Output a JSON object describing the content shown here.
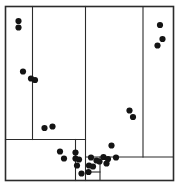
{
  "figure": {
    "title": "",
    "width": 180,
    "height": 188,
    "background_color": "#ffffff",
    "line_color": "#2b2b2b",
    "point_color": "#141414"
  },
  "chart_data": {
    "type": "scatter",
    "title": "",
    "subtitle": "",
    "xlabel": "",
    "ylabel": "",
    "xlim": [
      0,
      180
    ],
    "ylim": [
      0,
      188
    ],
    "grid": false,
    "legend": null,
    "annotations": [],
    "point_radius": 3.1,
    "points": [
      {
        "x": 18.5,
        "y": 21.0
      },
      {
        "x": 18.5,
        "y": 27.5
      },
      {
        "x": 160.0,
        "y": 25.0
      },
      {
        "x": 162.5,
        "y": 39.0
      },
      {
        "x": 157.5,
        "y": 45.5
      },
      {
        "x": 23.0,
        "y": 71.5
      },
      {
        "x": 31.0,
        "y": 78.5
      },
      {
        "x": 35.0,
        "y": 80.0
      },
      {
        "x": 129.5,
        "y": 110.5
      },
      {
        "x": 133.0,
        "y": 117.0
      },
      {
        "x": 44.5,
        "y": 128.0
      },
      {
        "x": 52.5,
        "y": 126.5
      },
      {
        "x": 111.5,
        "y": 145.5
      },
      {
        "x": 60.0,
        "y": 151.5
      },
      {
        "x": 75.5,
        "y": 152.5
      },
      {
        "x": 64.0,
        "y": 158.5
      },
      {
        "x": 75.5,
        "y": 158.5
      },
      {
        "x": 79.0,
        "y": 159.5
      },
      {
        "x": 91.0,
        "y": 157.5
      },
      {
        "x": 103.5,
        "y": 157.0
      },
      {
        "x": 108.0,
        "y": 159.0
      },
      {
        "x": 116.0,
        "y": 157.5
      },
      {
        "x": 77.0,
        "y": 165.5
      },
      {
        "x": 96.5,
        "y": 160.5
      },
      {
        "x": 99.5,
        "y": 161.5
      },
      {
        "x": 89.0,
        "y": 165.5
      },
      {
        "x": 106.5,
        "y": 163.5
      },
      {
        "x": 93.0,
        "y": 166.5
      },
      {
        "x": 81.5,
        "y": 173.5
      },
      {
        "x": 88.5,
        "y": 172.0
      }
    ],
    "partition_frame": {
      "x0": 5.5,
      "y0": 6.5,
      "x1": 173.5,
      "y1": 180.5
    },
    "partition_splits": [
      {
        "id": "split-v1",
        "orientation": "vertical",
        "x": 32.5,
        "y_from": 6.5,
        "y_to": 139.5
      },
      {
        "id": "split-v2",
        "orientation": "vertical",
        "x": 85.5,
        "y_from": 6.5,
        "y_to": 180.5
      },
      {
        "id": "split-v3",
        "orientation": "vertical",
        "x": 143.0,
        "y_from": 6.5,
        "y_to": 157.0
      },
      {
        "id": "split-h1",
        "orientation": "horizontal",
        "y": 139.5,
        "x_from": 5.5,
        "x_to": 85.5
      },
      {
        "id": "split-h2",
        "orientation": "horizontal",
        "y": 157.0,
        "x_from": 85.5,
        "x_to": 173.5
      },
      {
        "id": "split-v4",
        "orientation": "vertical",
        "x": 75.5,
        "y_from": 139.5,
        "y_to": 180.5
      },
      {
        "id": "split-v5",
        "orientation": "vertical",
        "x": 100.0,
        "y_from": 157.0,
        "y_to": 180.5
      },
      {
        "id": "split-h3",
        "orientation": "horizontal",
        "y": 172.0,
        "x_from": 85.5,
        "x_to": 100.0
      }
    ]
  }
}
